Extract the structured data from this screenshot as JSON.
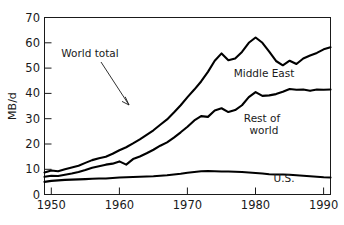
{
  "chart_data": {
    "type": "line",
    "title": "",
    "subtitle": "",
    "xlabel": "",
    "ylabel": "MB/d",
    "xlim": [
      1949,
      1991
    ],
    "ylim": [
      0,
      70
    ],
    "grid": false,
    "legend_position": "inline-annotations",
    "x_ticks": [
      1950,
      1960,
      1970,
      1980,
      1990
    ],
    "x_tick_labels": [
      "1950",
      "1960",
      "1970",
      "1980",
      "1990"
    ],
    "y_ticks": [
      0,
      10,
      20,
      30,
      40,
      50,
      60,
      70
    ],
    "y_tick_labels": [
      "0",
      "10",
      "20",
      "30",
      "40",
      "50",
      "60",
      "70"
    ],
    "annotations": [
      {
        "text": "World total",
        "x": 1962.5,
        "y": 55.5,
        "note": "with leader arrow pointing to world total curve near 1968"
      },
      {
        "text": "Middle East",
        "x": 1981.5,
        "y": 46.5
      },
      {
        "text": "Rest of",
        "x": 1981.0,
        "y": 28.5
      },
      {
        "text": "world",
        "x": 1981.6,
        "y": 25.0
      },
      {
        "text": "U.S.",
        "x": 1984.5,
        "y": 3.2
      }
    ],
    "x": [
      1949,
      1950,
      1951,
      1952,
      1953,
      1954,
      1955,
      1956,
      1957,
      1958,
      1959,
      1960,
      1961,
      1962,
      1963,
      1964,
      1965,
      1966,
      1967,
      1968,
      1969,
      1970,
      1971,
      1972,
      1973,
      1974,
      1975,
      1976,
      1977,
      1978,
      1979,
      1980,
      1981,
      1982,
      1983,
      1984,
      1985,
      1986,
      1987,
      1988,
      1989,
      1990,
      1991
    ],
    "series": [
      {
        "name": "World total",
        "label": "World total",
        "values": [
          8.7,
          9.5,
          9.2,
          10.0,
          10.7,
          11.4,
          12.5,
          13.6,
          14.3,
          14.9,
          16.1,
          17.5,
          18.7,
          20.2,
          21.8,
          23.6,
          25.4,
          27.6,
          29.7,
          32.4,
          35.3,
          38.5,
          41.5,
          44.7,
          48.5,
          52.9,
          55.8,
          53.1,
          53.8,
          56.4,
          60.0,
          62.1,
          60.0,
          56.5,
          52.8,
          51.1,
          52.9,
          51.6,
          53.8,
          55.0,
          56.0,
          57.4,
          58.2
        ]
      },
      {
        "name": "Middle East",
        "label": "Middle East",
        "values": [
          null,
          null,
          null,
          null,
          null,
          null,
          null,
          null,
          null,
          null,
          null,
          null,
          null,
          null,
          null,
          null,
          null,
          null,
          null,
          null,
          null,
          null,
          null,
          null,
          null,
          null,
          null,
          null,
          null,
          null,
          null,
          null,
          null,
          null,
          null,
          null,
          null,
          null,
          null,
          null,
          null,
          null,
          null
        ],
        "note": "Middle East is the band between the World total curve and the Rest-of-world curve; labelled inline, no separate line drawn."
      },
      {
        "name": "Rest of world",
        "label": "Rest of world",
        "values": [
          7.0,
          7.4,
          7.3,
          7.8,
          8.3,
          8.9,
          9.7,
          10.6,
          11.2,
          11.8,
          12.2,
          13.1,
          11.8,
          14.0,
          15.0,
          16.3,
          17.7,
          19.3,
          20.6,
          22.5,
          24.6,
          26.8,
          29.3,
          31.0,
          30.7,
          33.2,
          34.1,
          32.6,
          33.4,
          35.3,
          38.5,
          40.5,
          39.0,
          39.2,
          39.7,
          40.6,
          41.7,
          41.4,
          41.5,
          41.0,
          41.5,
          41.4,
          41.5
        ]
      },
      {
        "name": "U.S.",
        "label": "U.S.",
        "values": [
          5.0,
          5.4,
          5.6,
          5.8,
          5.9,
          6.0,
          6.1,
          6.2,
          6.3,
          6.3,
          6.5,
          6.7,
          6.8,
          6.9,
          7.0,
          7.1,
          7.2,
          7.4,
          7.6,
          7.9,
          8.2,
          8.6,
          8.9,
          9.2,
          9.3,
          9.2,
          9.1,
          9.1,
          9.0,
          8.9,
          8.7,
          8.5,
          8.3,
          8.0,
          7.9,
          7.9,
          7.8,
          7.6,
          7.4,
          7.2,
          7.0,
          6.8,
          6.7
        ]
      }
    ]
  },
  "axes": {
    "y_axis_title": "MB/d"
  }
}
